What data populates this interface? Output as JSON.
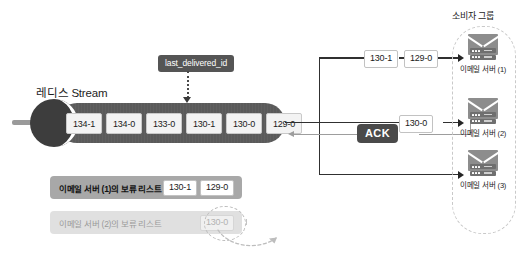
{
  "diagram": {
    "stream": {
      "title": "레디스 Stream",
      "entries": [
        "134-1",
        "134-0",
        "133-0",
        "130-1",
        "130-0",
        "129-0"
      ],
      "pointer_label": "last_delivered_id"
    },
    "consumer_group": {
      "label": "소비자 그룹",
      "servers": [
        {
          "name": "이메일 서버 (1)",
          "icon": "email-server-icon"
        },
        {
          "name": "이메일 서버 (2)",
          "icon": "email-server-icon"
        },
        {
          "name": "이메일 서버 (3)",
          "icon": "email-server-icon"
        }
      ]
    },
    "deliveries": {
      "to_server_1": [
        "130-1",
        "129-0"
      ],
      "to_server_2": [
        "130-0"
      ],
      "ack_label": "ACK"
    },
    "pending_lists": [
      {
        "title": "이메일 서버 (1)의 보류 리스트",
        "entries": [
          "130-1",
          "129-0"
        ],
        "state": "active"
      },
      {
        "title": "이메일 서버 (2)의 보류 리스트",
        "entries": [
          "130-0"
        ],
        "state": "removed"
      }
    ],
    "colors": {
      "stream_body": "#5a5a5a",
      "stream_cap": "#3d3d3d",
      "badge": "#555555",
      "ack_badge": "#4a4a4a",
      "pending_active": "#a8a8a8",
      "pending_removed": "#e0e0e0",
      "wire": "#303030",
      "wire_light": "#9d9d9d",
      "group_border": "#c9c9c9"
    }
  }
}
